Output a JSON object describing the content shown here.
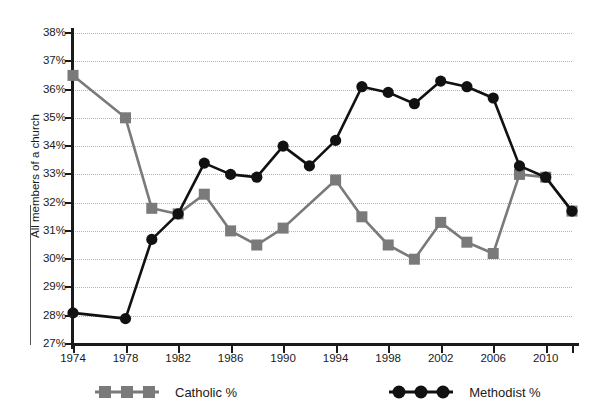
{
  "chart_data": {
    "type": "line",
    "title": "",
    "xlabel": "",
    "ylabel": "All members of a church",
    "ylim": [
      27,
      38
    ],
    "ytick_labels": [
      "38%",
      "37%",
      "36%",
      "35%",
      "34%",
      "33%",
      "32%",
      "31%",
      "30%",
      "29%",
      "28%",
      "27%"
    ],
    "ytick_values": [
      38,
      37,
      36,
      35,
      34,
      33,
      32,
      31,
      30,
      29,
      28,
      27
    ],
    "xtick_labels": [
      "1974",
      "1978",
      "1982",
      "1986",
      "1990",
      "1994",
      "1998",
      "2002",
      "2006",
      "2010"
    ],
    "xtick_values": [
      1974,
      1978,
      1982,
      1986,
      1990,
      1994,
      1998,
      2002,
      2006,
      2010
    ],
    "xlim": [
      1974,
      2012
    ],
    "x": [
      1974,
      1976,
      1978,
      1980,
      1982,
      1984,
      1986,
      1988,
      1990,
      1992,
      1994,
      1996,
      1998,
      2000,
      2002,
      2004,
      2006,
      2008,
      2010,
      2012
    ],
    "grid": true,
    "legend_position": "bottom",
    "series": [
      {
        "name": "Catholic %",
        "color": "#7a7a7a",
        "marker": "square",
        "values": [
          36.5,
          null,
          35.0,
          31.8,
          31.6,
          32.3,
          31.0,
          30.5,
          31.1,
          null,
          32.8,
          31.5,
          30.5,
          30.0,
          31.3,
          30.6,
          30.2,
          33.0,
          32.9,
          31.7
        ]
      },
      {
        "name": "Methodist %",
        "color": "#111111",
        "marker": "circle",
        "values": [
          28.1,
          null,
          27.9,
          30.7,
          31.6,
          33.4,
          33.0,
          32.9,
          34.0,
          33.3,
          34.2,
          36.1,
          35.9,
          35.5,
          36.3,
          36.1,
          35.7,
          33.3,
          32.9,
          31.7
        ]
      }
    ]
  },
  "legend": {
    "catholic_label": "Catholic %",
    "methodist_label": "Methodist %"
  }
}
